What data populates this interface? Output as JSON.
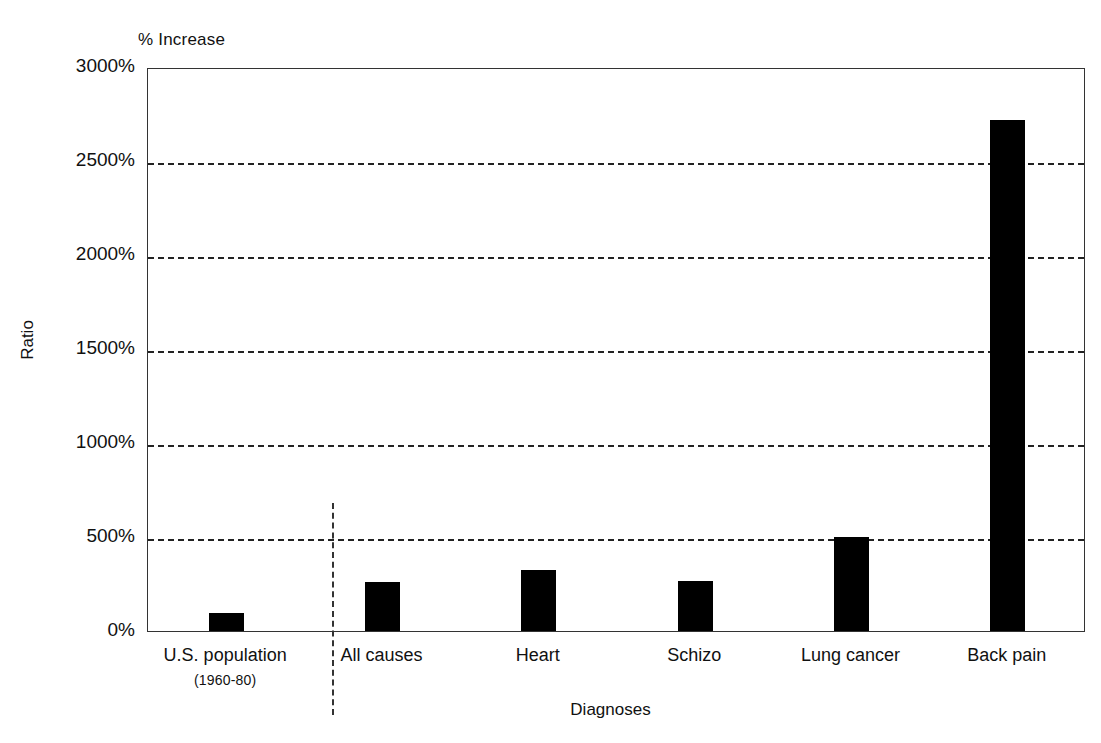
{
  "chart_data": {
    "type": "bar",
    "title": "",
    "subtitle": "",
    "unit_label": "% Increase",
    "xlabel": "Diagnoses",
    "ylabel": "Ratio",
    "categories": [
      "U.S. population",
      "All causes",
      "Heart",
      "Schizo",
      "Lung cancer",
      "Back pain"
    ],
    "category_sublabels": [
      "(1960-80)",
      "",
      "",
      "",
      "",
      ""
    ],
    "values": [
      97,
      263,
      322,
      268,
      500,
      2720
    ],
    "value_unit": "%",
    "ylim": [
      0,
      3000
    ],
    "yticks": [
      0,
      500,
      1000,
      1500,
      2000,
      2500,
      3000
    ],
    "ytick_labels": [
      "0%",
      "500%",
      "1000%",
      "1500%",
      "2000%",
      "2500%",
      "3000%"
    ],
    "grid": "horizontal-dashed",
    "legend": "none",
    "bar_color": "#000000",
    "annotations": [
      {
        "name": "reference-group-separator",
        "style": "vertical-dashed-line",
        "after_category": "U.S. population"
      }
    ]
  },
  "colors": {
    "bar": "#000000",
    "axis": "#333333",
    "grid": "#222222",
    "text": "#111111",
    "background": "#ffffff"
  }
}
